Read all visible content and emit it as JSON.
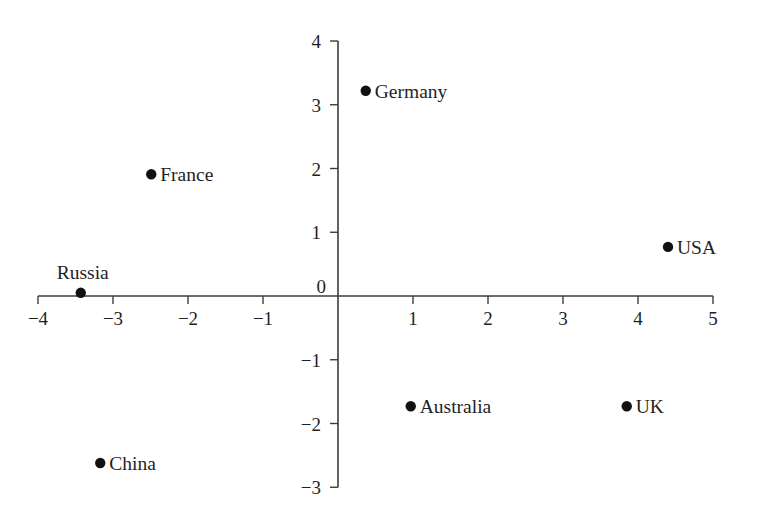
{
  "chart_data": {
    "type": "scatter",
    "title": "",
    "xlabel": "",
    "ylabel": "",
    "xlim": [
      -4,
      5
    ],
    "ylim": [
      -3,
      4
    ],
    "grid": false,
    "legend": null,
    "axis_style": "crossed-at-origin",
    "xticks": [
      -4,
      -3,
      -2,
      -1,
      0,
      1,
      2,
      3,
      4,
      5
    ],
    "yticks": [
      -3,
      -2,
      -1,
      0,
      1,
      2,
      3,
      4
    ],
    "xtick_labels": [
      "−4",
      "−3",
      "−2",
      "−1",
      "0",
      "1",
      "2",
      "3",
      "4",
      "5"
    ],
    "ytick_labels": [
      "−3",
      "−2",
      "−1",
      "0",
      "1",
      "2",
      "3",
      "4"
    ],
    "points": [
      {
        "label": "Germany",
        "x": 0.37,
        "y": 3.22,
        "label_pos": "right"
      },
      {
        "label": "France",
        "x": -2.49,
        "y": 1.91,
        "label_pos": "right"
      },
      {
        "label": "USA",
        "x": 4.4,
        "y": 0.77,
        "label_pos": "right"
      },
      {
        "label": "Russia",
        "x": -3.43,
        "y": 0.05,
        "label_pos": "above"
      },
      {
        "label": "Australia",
        "x": 0.97,
        "y": -1.73,
        "label_pos": "right"
      },
      {
        "label": "UK",
        "x": 3.85,
        "y": -1.73,
        "label_pos": "right"
      },
      {
        "label": "China",
        "x": -3.17,
        "y": -2.62,
        "label_pos": "right"
      }
    ],
    "colors": {
      "marker": "#111111",
      "axis": "#3d3d3d",
      "text": "#1f1f1f",
      "background": "#ffffff"
    }
  }
}
